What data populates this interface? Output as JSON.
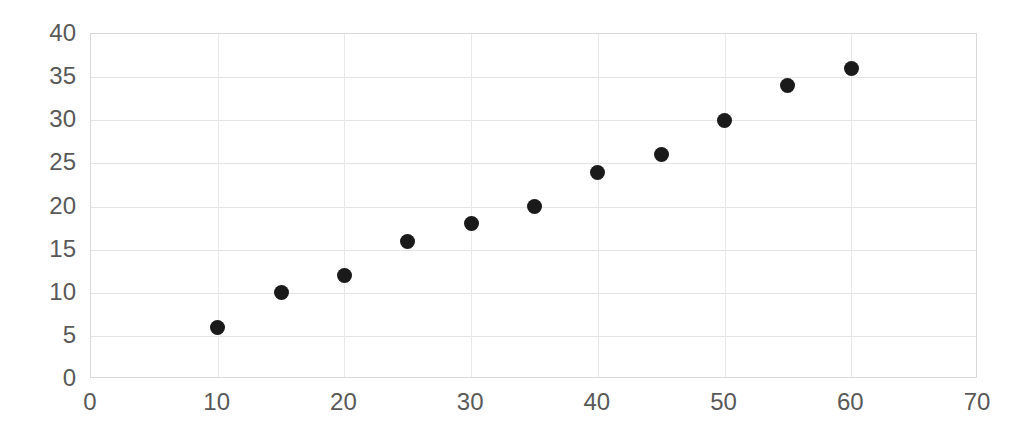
{
  "chart_data": {
    "type": "scatter",
    "title": "",
    "xlabel": "",
    "ylabel": "",
    "xlim": [
      0,
      70
    ],
    "ylim": [
      0,
      40
    ],
    "xticks": [
      0,
      10,
      20,
      30,
      40,
      50,
      60,
      70
    ],
    "yticks": [
      0,
      5,
      10,
      15,
      20,
      25,
      30,
      35,
      40
    ],
    "grid": true,
    "legend": false,
    "marker": {
      "shape": "circle",
      "color": "#1a1a1a",
      "size_px": 15
    },
    "axis_color": "#d9d9d9",
    "gridline_color": "#e4e4e4",
    "tick_label_color": "#595959",
    "background": "#ffffff",
    "series": [
      {
        "name": "Series 1",
        "x": [
          10,
          15,
          20,
          25,
          30,
          35,
          40,
          45,
          50,
          55,
          60
        ],
        "y": [
          6,
          10,
          12,
          16,
          18,
          20,
          24,
          26,
          30,
          34,
          36
        ],
        "points": [
          {
            "x": 10,
            "y": 6
          },
          {
            "x": 15,
            "y": 10
          },
          {
            "x": 20,
            "y": 12
          },
          {
            "x": 25,
            "y": 16
          },
          {
            "x": 30,
            "y": 18
          },
          {
            "x": 35,
            "y": 20
          },
          {
            "x": 40,
            "y": 24
          },
          {
            "x": 45,
            "y": 26
          },
          {
            "x": 50,
            "y": 30
          },
          {
            "x": 55,
            "y": 34
          },
          {
            "x": 60,
            "y": 36
          }
        ]
      }
    ]
  }
}
